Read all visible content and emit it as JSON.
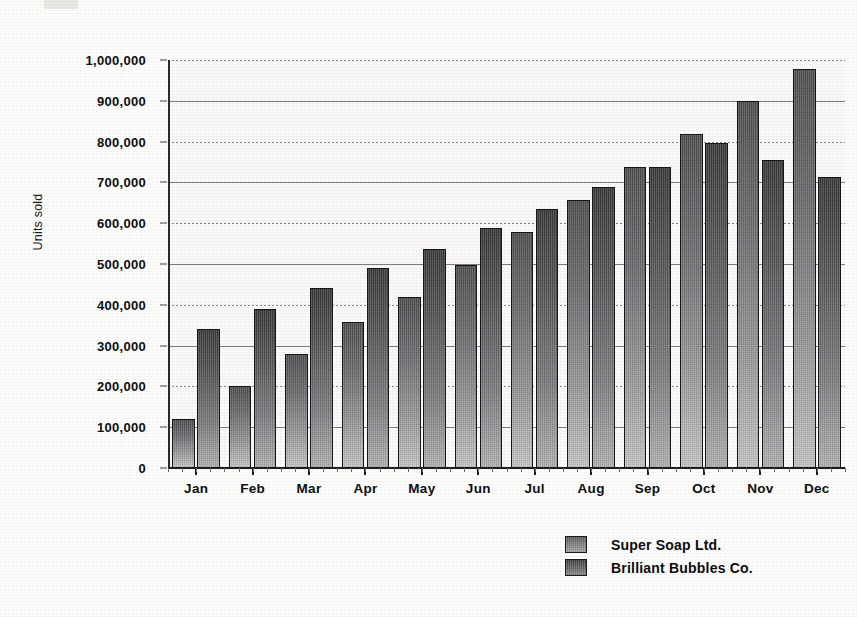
{
  "chart_data": {
    "type": "bar",
    "title": "",
    "xlabel": "",
    "ylabel": "Units sold",
    "ylim": [
      0,
      1000000
    ],
    "ytick_step": 100000,
    "grid": true,
    "grid_axis": "y",
    "legend_position": "bottom-right",
    "categories": [
      "Jan",
      "Feb",
      "Mar",
      "Apr",
      "May",
      "Jun",
      "Jul",
      "Aug",
      "Sep",
      "Oct",
      "Nov",
      "Dec"
    ],
    "ytick_labels": [
      "0",
      "100,000",
      "200,000",
      "300,000",
      "400,000",
      "500,000",
      "600,000",
      "700,000",
      "800,000",
      "900,000",
      "1,000,000"
    ],
    "ytick_values": [
      0,
      100000,
      200000,
      300000,
      400000,
      500000,
      600000,
      700000,
      800000,
      900000,
      1000000
    ],
    "series": [
      {
        "name": "Super Soap Ltd.",
        "color": "#838386",
        "values": [
          120000,
          200000,
          280000,
          358000,
          420000,
          497000,
          578000,
          658000,
          737000,
          818000,
          900000,
          977000
        ]
      },
      {
        "name": "Brilliant Bubbles Co.",
        "color": "#626265",
        "values": [
          340000,
          390000,
          440000,
          490000,
          537000,
          588000,
          635000,
          688000,
          737000,
          797000,
          755000,
          713000
        ]
      }
    ]
  },
  "legend": {
    "entries": [
      {
        "label": "Super Soap Ltd.",
        "swatch": "series-1-swatch"
      },
      {
        "label": "Brilliant Bubbles Co.",
        "swatch": "series-2-swatch"
      }
    ]
  },
  "axes": {
    "y_title": "Units sold"
  },
  "colors": {
    "series_1": "#838386",
    "series_2": "#626265",
    "axis": "#1d1d1d",
    "grid": "#8a8a8a",
    "plot_background": "#fbfaf8",
    "page_background": "#fdfdfc",
    "text": "#0f0f0f"
  }
}
